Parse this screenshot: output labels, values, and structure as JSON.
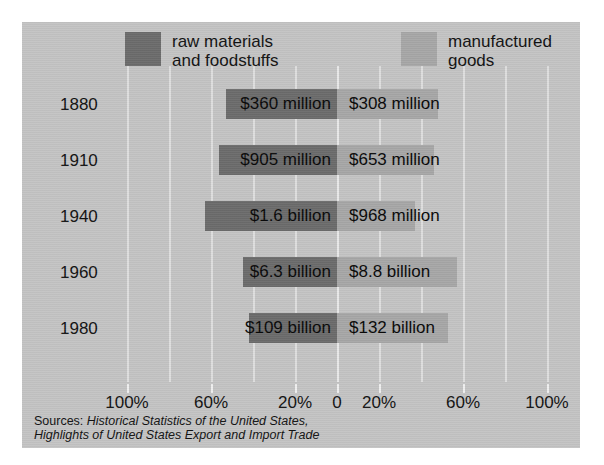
{
  "legend": {
    "raw": {
      "label": "raw materials\nand foodstuffs",
      "color": "#6b6b6b",
      "swatch_name": "raw-materials-swatch"
    },
    "mfg": {
      "label": "manufactured\ngoods",
      "color": "#a6a6a6",
      "swatch_name": "manufactured-goods-swatch"
    }
  },
  "axis": {
    "zero_label": "0",
    "ticks": [
      "100%",
      "60%",
      "20%",
      "0",
      "20%",
      "60%",
      "100%"
    ]
  },
  "sources": {
    "lead": "Sources: ",
    "line1": "Historical Statistics of the United States,",
    "line2": "Highlights of United States Export and Import Trade"
  },
  "rows": [
    {
      "year": "1880",
      "raw_label": "$360 million",
      "mfg_label": "$308 million",
      "raw_pct": 53,
      "mfg_pct": 48
    },
    {
      "year": "1910",
      "raw_label": "$905 million",
      "mfg_label": "$653 million",
      "raw_pct": 56,
      "mfg_pct": 46
    },
    {
      "year": "1940",
      "raw_label": "$1.6 billion",
      "mfg_label": "$968 million",
      "raw_pct": 63,
      "mfg_pct": 37
    },
    {
      "year": "1960",
      "raw_label": "$6.3 billion",
      "mfg_label": "$8.8 billion",
      "raw_pct": 45,
      "mfg_pct": 57
    },
    {
      "year": "1980",
      "raw_label": "$109 billion",
      "mfg_label": "$132 billion",
      "raw_pct": 42,
      "mfg_pct": 53
    }
  ],
  "chart_data": {
    "type": "bar",
    "orientation": "horizontal-diverging",
    "title": "",
    "xlabel": "",
    "ylabel": "",
    "categories": [
      "1880",
      "1910",
      "1940",
      "1960",
      "1980"
    ],
    "series": [
      {
        "name": "raw materials and foodstuffs",
        "side": "left",
        "color": "#6b6b6b",
        "values": [
          53,
          56,
          63,
          45,
          42
        ],
        "value_labels": [
          "$360 million",
          "$905 million",
          "$1.6 billion",
          "$6.3 billion",
          "$109 billion"
        ]
      },
      {
        "name": "manufactured goods",
        "side": "right",
        "color": "#a6a6a6",
        "values": [
          48,
          46,
          37,
          57,
          53
        ],
        "value_labels": [
          "$308 million",
          "$653 million",
          "$968 million",
          "$8.8 billion",
          "$132 billion"
        ]
      }
    ],
    "xticks": [
      -100,
      -60,
      -20,
      0,
      20,
      60,
      100
    ],
    "xticklabels": [
      "100%",
      "60%",
      "20%",
      "0",
      "20%",
      "60%",
      "100%"
    ],
    "xlim": [
      -100,
      100
    ],
    "grid": true,
    "legend_position": "top",
    "background_color": "#c3c3c3",
    "gridline_color": "#dedede"
  }
}
